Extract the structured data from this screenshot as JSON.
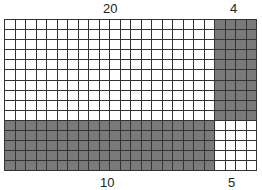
{
  "diagram": {
    "type": "area-model-grid",
    "columns": 24,
    "rows": 15,
    "cell_width": 10.5,
    "cell_height": 10.1,
    "colors": {
      "white": "#ffffff",
      "gray": "#7a7a7a",
      "line": "#333333"
    },
    "top_labels": {
      "left": "20",
      "right": "4"
    },
    "bottom_labels": {
      "left": "10",
      "right": "5"
    },
    "regions": [
      {
        "name": "top-left",
        "cols": [
          0,
          20
        ],
        "rows": [
          0,
          10
        ],
        "fill": "white"
      },
      {
        "name": "top-right",
        "cols": [
          20,
          24
        ],
        "rows": [
          0,
          10
        ],
        "fill": "gray"
      },
      {
        "name": "bottom-left",
        "cols": [
          0,
          20
        ],
        "rows": [
          10,
          15
        ],
        "fill": "gray"
      },
      {
        "name": "bottom-right",
        "cols": [
          20,
          24
        ],
        "rows": [
          10,
          15
        ],
        "fill": "white"
      }
    ]
  }
}
